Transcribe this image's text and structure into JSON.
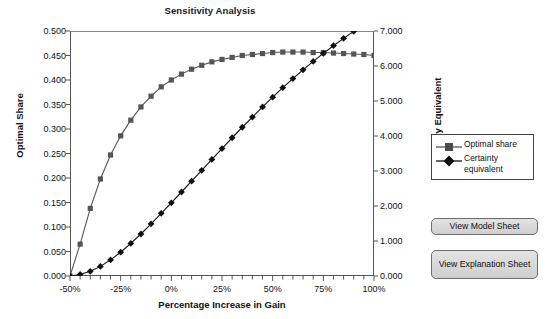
{
  "chart_data": {
    "type": "line",
    "title": "Sensitivity Analysis",
    "xlabel": "Percentage Increase in Gain",
    "ylabel": "Optimal Share",
    "ylabel_right": "Certainty Equivalent",
    "grid": false,
    "legend_position": "right",
    "xlim": [
      -50,
      100
    ],
    "ylim": [
      0.0,
      0.5
    ],
    "ylim_right": [
      0.0,
      7.0
    ],
    "xticks": [
      "-50%",
      "-25%",
      "0%",
      "25%",
      "50%",
      "75%",
      "100%"
    ],
    "xtick_values": [
      -50,
      -25,
      0,
      25,
      50,
      75,
      100
    ],
    "xtick_minor_step": 5,
    "yticks_left": [
      "0.000",
      "0.050",
      "0.100",
      "0.150",
      "0.200",
      "0.250",
      "0.300",
      "0.350",
      "0.400",
      "0.450",
      "0.500"
    ],
    "ytick_left_values": [
      0.0,
      0.05,
      0.1,
      0.15,
      0.2,
      0.25,
      0.3,
      0.35,
      0.4,
      0.45,
      0.5
    ],
    "yticks_right": [
      "0.000",
      "1.000",
      "2.000",
      "3.000",
      "4.000",
      "5.000",
      "6.000",
      "7.000"
    ],
    "ytick_right_values": [
      0,
      1,
      2,
      3,
      4,
      5,
      6,
      7
    ],
    "x": [
      -50,
      -45,
      -40,
      -35,
      -30,
      -25,
      -20,
      -15,
      -10,
      -5,
      0,
      5,
      10,
      15,
      20,
      25,
      30,
      35,
      40,
      45,
      50,
      55,
      60,
      65,
      70,
      75,
      80,
      85,
      90,
      95,
      100
    ],
    "series": [
      {
        "name": "Optimal share",
        "axis": "left",
        "color": "#555555",
        "marker": "square",
        "values": [
          0.0,
          0.065,
          0.138,
          0.198,
          0.247,
          0.286,
          0.318,
          0.345,
          0.367,
          0.386,
          0.4,
          0.412,
          0.422,
          0.43,
          0.437,
          0.442,
          0.446,
          0.45,
          0.452,
          0.454,
          0.456,
          0.457,
          0.457,
          0.457,
          0.456,
          0.456,
          0.455,
          0.454,
          0.453,
          0.452,
          0.45
        ]
      },
      {
        "name": "Certainty equivalent",
        "axis": "right",
        "color": "#111111",
        "marker": "diamond",
        "values": [
          0.0,
          0.045,
          0.135,
          0.275,
          0.46,
          0.68,
          0.93,
          1.2,
          1.49,
          1.79,
          2.09,
          2.4,
          2.71,
          3.02,
          3.33,
          3.64,
          3.95,
          4.25,
          4.54,
          4.83,
          5.11,
          5.38,
          5.64,
          5.89,
          6.13,
          6.36,
          6.58,
          6.79,
          6.99,
          7.18,
          7.36
        ]
      }
    ]
  },
  "legend": {
    "items": [
      {
        "label": "Optimal share",
        "marker": "square",
        "color": "#555555"
      },
      {
        "label": "Certainty equivalent",
        "marker": "diamond",
        "color": "#111111"
      }
    ]
  },
  "buttons": {
    "view_model_sheet": "View Model Sheet",
    "view_explanation_sheet": "View Explanation Sheet"
  },
  "colors": {
    "optimal_share": "#555555",
    "certainty_equivalent": "#111111",
    "axis": "#555555",
    "button_face": "#d8d8d8",
    "background": "#ffffff"
  }
}
